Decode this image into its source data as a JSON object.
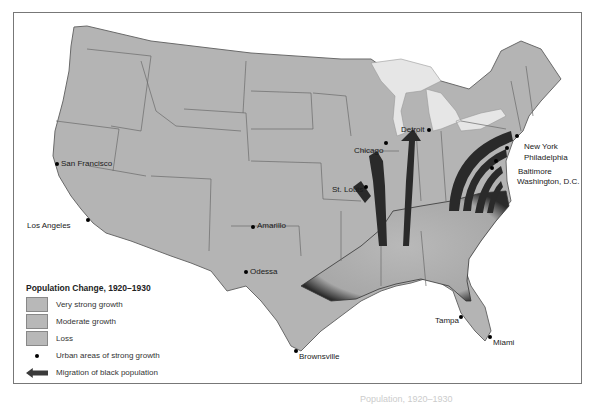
{
  "map": {
    "legend": {
      "title": "Population Change, 1920–1930",
      "items": [
        {
          "label": "Very strong growth",
          "color": "#b8b8b8"
        },
        {
          "label": "Moderate growth",
          "color": "#b8b8b8"
        },
        {
          "label": "Loss",
          "color": "#b8b8b8"
        },
        {
          "label": "Urban areas of strong growth",
          "symbol": "dot"
        },
        {
          "label": "Migration of black population",
          "symbol": "arrow"
        }
      ]
    },
    "cities": [
      {
        "name": "San Francisco",
        "x": 56,
        "y": 162
      },
      {
        "name": "Los Angeles",
        "x": 87,
        "y": 220
      },
      {
        "name": "Amarillo",
        "x": 252,
        "y": 225
      },
      {
        "name": "Odessa",
        "x": 245,
        "y": 270
      },
      {
        "name": "Brownsville",
        "x": 295,
        "y": 350
      },
      {
        "name": "St. Louis",
        "x": 364,
        "y": 188
      },
      {
        "name": "Chicago",
        "x": 384,
        "y": 142
      },
      {
        "name": "Detroit",
        "x": 426,
        "y": 130
      },
      {
        "name": "New York",
        "x": 514,
        "y": 135
      },
      {
        "name": "Philadelphia",
        "x": 505,
        "y": 146
      },
      {
        "name": "Baltimore",
        "x": 494,
        "y": 160
      },
      {
        "name": "Washington, D.C.",
        "x": 490,
        "y": 168
      },
      {
        "name": "Tampa",
        "x": 459,
        "y": 315
      },
      {
        "name": "Miami",
        "x": 488,
        "y": 336
      }
    ],
    "caption": "Population, 1920–1930",
    "colors": {
      "land": "#b4b4b4",
      "water": "#ffffff",
      "lakes": "#e6e6e6",
      "border": "#6a6a6a",
      "arrow": "#2a2a2a",
      "frame": "#777777"
    }
  }
}
